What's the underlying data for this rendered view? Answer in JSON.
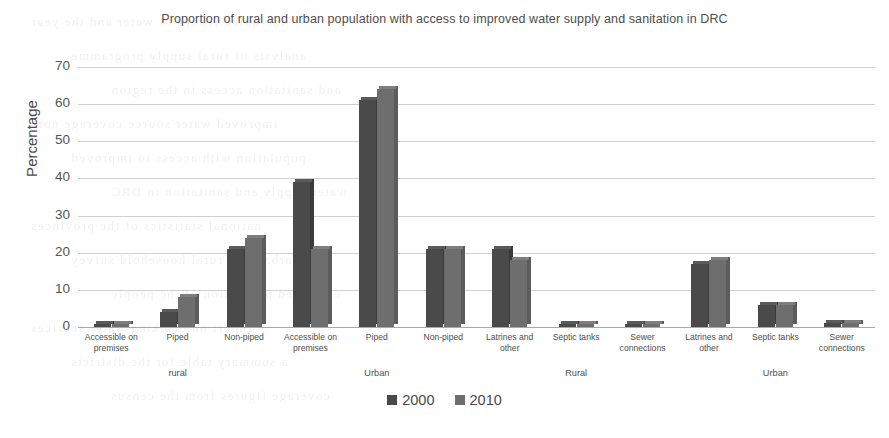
{
  "chart_data": {
    "type": "bar",
    "title": "Proportion of rural and urban population with access to improved water supply and sanitation in DRC",
    "xlabel": "",
    "ylabel": "Percentage",
    "ylim": [
      0,
      70
    ],
    "yticks": [
      0,
      10,
      20,
      30,
      40,
      50,
      60,
      70
    ],
    "grid": true,
    "legend_position": "bottom",
    "categories": [
      "Accessible on premises",
      "Piped",
      "Non-piped",
      "Accessible on premises",
      "Piped",
      "Non-piped",
      "Latrines and other",
      "Septic tanks",
      "Sewer connections",
      "Latrines and other",
      "Septic tanks",
      "Sewer connections"
    ],
    "group_labels": [
      {
        "label": "rural",
        "start": 0,
        "end": 2
      },
      {
        "label": "Urban",
        "start": 3,
        "end": 5
      },
      {
        "label": "Rural",
        "start": 6,
        "end": 8
      },
      {
        "label": "Urban",
        "start": 9,
        "end": 11
      }
    ],
    "series": [
      {
        "name": "2000",
        "color": "#4a4a4a",
        "values": [
          0.5,
          4,
          21,
          39,
          61,
          21,
          21,
          0.5,
          0.5,
          17,
          6,
          1
        ]
      },
      {
        "name": "2010",
        "color": "#6e6e6e",
        "values": [
          0.5,
          8,
          24,
          21,
          64,
          21,
          18,
          0.5,
          0.5,
          18,
          6,
          1
        ]
      }
    ]
  },
  "background_bleed": [
    "the quick record of water and the year",
    "analysis of rural supply programme",
    "and sanitation access in the region",
    "improved water source coverage note",
    "population with access to improved",
    "water supply and sanitation in DRC",
    "national statistics of the provinces",
    "urban and rural household survey",
    "estimated proportion of the people",
    "report on drinking water services",
    "a summary table for the districts",
    "coverage figures from the census"
  ]
}
